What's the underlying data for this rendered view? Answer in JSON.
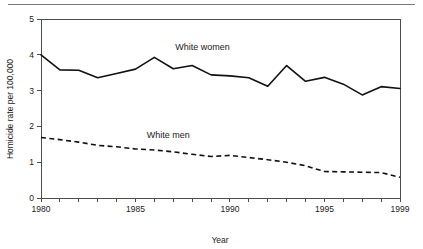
{
  "figure": {
    "has_top_rule": true,
    "background_color": "#ffffff",
    "line_color": "#111111",
    "axis_color": "#4d4d4d",
    "rule_color": "#7a7a7a"
  },
  "chart_data": {
    "type": "line",
    "title": "",
    "subtitle": "",
    "xlabel": "Year",
    "ylabel": "Homicide rate per 100,000",
    "xlim": [
      1980,
      1999
    ],
    "ylim": [
      0,
      5
    ],
    "grid": false,
    "legend_position": "inline-annotation",
    "x": [
      1980,
      1981,
      1982,
      1983,
      1984,
      1985,
      1986,
      1987,
      1988,
      1989,
      1990,
      1991,
      1992,
      1993,
      1994,
      1995,
      1996,
      1997,
      1998,
      1999
    ],
    "xtick_values": [
      1980,
      1981,
      1982,
      1983,
      1984,
      1985,
      1986,
      1987,
      1988,
      1989,
      1990,
      1991,
      1992,
      1993,
      1994,
      1995,
      1996,
      1997,
      1998,
      1999
    ],
    "xtick_labels_shown": [
      "1980",
      "1985",
      "1990",
      "1995",
      "1999"
    ],
    "xtick_labels_shown_values": [
      1980,
      1985,
      1990,
      1995,
      1999
    ],
    "ytick_values": [
      0,
      1,
      2,
      3,
      4,
      5
    ],
    "ytick_labels": [
      "0",
      "1",
      "2",
      "3",
      "4",
      "5"
    ],
    "series": [
      {
        "name": "White women",
        "style": "solid",
        "label": "White women",
        "label_x": 1987.1,
        "label_y": 4.13,
        "values": [
          4.0,
          3.58,
          3.57,
          3.36,
          3.48,
          3.6,
          3.93,
          3.61,
          3.7,
          3.44,
          3.41,
          3.36,
          3.12,
          3.7,
          3.26,
          3.37,
          3.18,
          2.88,
          3.11,
          3.06
        ]
      },
      {
        "name": "White men",
        "style": "dashed",
        "label": "White men",
        "label_x": 1985.6,
        "label_y": 1.68,
        "values": [
          1.69,
          1.63,
          1.56,
          1.47,
          1.43,
          1.37,
          1.34,
          1.29,
          1.22,
          1.16,
          1.19,
          1.13,
          1.07,
          1.0,
          0.9,
          0.74,
          0.73,
          0.72,
          0.71,
          0.58
        ]
      }
    ]
  },
  "plot_geometry": {
    "left": 41,
    "right": 400,
    "top": 19,
    "bottom": 198
  }
}
